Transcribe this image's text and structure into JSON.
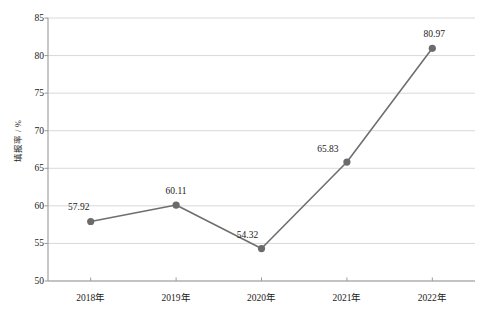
{
  "chart_data": {
    "type": "line",
    "title": "",
    "subtitle": "",
    "xlabel": "",
    "ylabel": "填报率 / %",
    "categories": [
      "2018年",
      "2019年",
      "2020年",
      "2021年",
      "2022年"
    ],
    "values": [
      57.92,
      60.11,
      54.32,
      65.83,
      80.97
    ],
    "point_labels": [
      "57.92",
      "60.11",
      "54.32",
      "65.83",
      "80.97"
    ],
    "series": [
      {
        "name": "填报率",
        "values": [
          57.92,
          60.11,
          54.32,
          65.83,
          80.97
        ]
      }
    ],
    "ylim": [
      50,
      85
    ],
    "y_ticks": [
      50,
      55,
      60,
      65,
      70,
      75,
      80,
      85
    ],
    "y_tick_labels": [
      "50",
      "55",
      "60",
      "65",
      "70",
      "75",
      "80",
      "85"
    ],
    "grid": "horizontal",
    "legend": "none",
    "line_color": "#6f6f6f",
    "marker_color": "#6b6b6b",
    "grid_color": "#d9d9d9",
    "axis_color": "#9a9a9a",
    "text_color": "#1a1a1a",
    "background_color": "#ffffff",
    "marker_shape": "circle"
  }
}
